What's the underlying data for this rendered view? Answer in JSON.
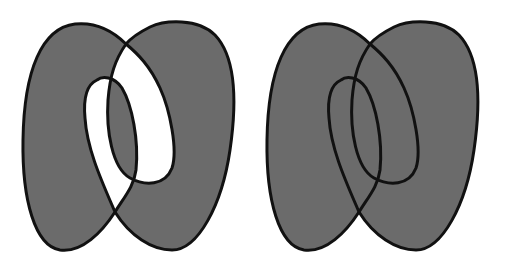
{
  "diagram": {
    "type": "fill-rule-comparison",
    "figures": [
      {
        "id": "left",
        "fill_rule": "evenodd",
        "offset_x": 0,
        "offset_y": 0
      },
      {
        "id": "right",
        "fill_rule": "nonzero",
        "offset_x": 244,
        "offset_y": 0
      }
    ],
    "colors": {
      "fill": "#6b6b6b",
      "stroke": "#111111",
      "background": "#ffffff"
    },
    "labels": {
      "left": "",
      "right": ""
    }
  }
}
